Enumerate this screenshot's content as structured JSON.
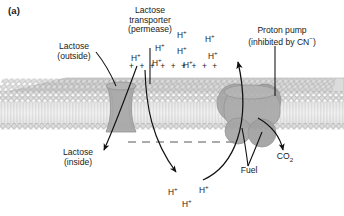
{
  "figure": {
    "panel_label": "(a)",
    "type": "membrane-transport-diagram",
    "title_implicit": "Lactose permease symport driven by proton gradient"
  },
  "labels": {
    "transporter": {
      "line1": "Lactose",
      "line2": "transporter",
      "line3": "(permease)"
    },
    "lactose_outside": {
      "line1": "Lactose",
      "line2": "(outside)"
    },
    "lactose_inside": {
      "line1": "Lactose",
      "line2": "(inside)"
    },
    "proton_pump": {
      "line1": "Proton pump",
      "line2": "(inhibited by CN",
      "charge": "−",
      "line2_end": ")"
    },
    "fuel": "Fuel",
    "co2": {
      "text": "CO",
      "subscript": "2"
    }
  },
  "ions": {
    "symbol": "H",
    "charge": "+",
    "outside_count": 8,
    "inside_count": 3,
    "outside_positions": [
      {
        "x": 177,
        "y": 29
      },
      {
        "x": 205,
        "y": 33
      },
      {
        "x": 155,
        "y": 42
      },
      {
        "x": 131,
        "y": 52
      },
      {
        "x": 177,
        "y": 45
      },
      {
        "x": 208,
        "y": 50
      },
      {
        "x": 152,
        "y": 57
      },
      {
        "x": 183,
        "y": 59
      }
    ],
    "inside_positions": [
      {
        "x": 168,
        "y": 186
      },
      {
        "x": 199,
        "y": 184
      },
      {
        "x": 182,
        "y": 198
      }
    ]
  },
  "charges": {
    "outer_row_symbol": "+",
    "outer_row_count": 9,
    "outer_row_label": "+ + + + + + + + +",
    "inner_row_symbol": "−",
    "inner_row_count": 8
  },
  "membrane": {
    "leaflets": 2,
    "headgroup_count_per_leaflet": 44,
    "description": "phospholipid bilayer slab in perspective"
  },
  "proteins": [
    {
      "name": "lactose-permease",
      "shape": "hourglass channel",
      "span": "transmembrane"
    },
    {
      "name": "proton-pump",
      "shape": "multi-lobed complex",
      "span": "transmembrane with cytosolic lobes"
    }
  ],
  "colors": {
    "membrane_head": "#d6d6d6",
    "membrane_tail": "#e8e8e8",
    "membrane_top": "#cfcfcf",
    "protein_fill": "#a8a8a8",
    "protein_stroke": "#8c8c8c",
    "arrow": "#111111",
    "text": "#1a1a1a",
    "background": "#ffffff"
  },
  "arrows": [
    {
      "name": "lactose-entry-arrow",
      "from": "outside",
      "to": "inside"
    },
    {
      "name": "lactose-leader-line",
      "from": "label",
      "to": "permease"
    },
    {
      "name": "transporter-leader-line",
      "from": "label",
      "to": "permease"
    },
    {
      "name": "proton-influx-arrow",
      "from": "outside-protons",
      "to": "cytosol"
    },
    {
      "name": "proton-efflux-arrow",
      "from": "cytosol-protons",
      "to": "outside"
    },
    {
      "name": "pump-leader-line",
      "from": "label",
      "to": "pump"
    },
    {
      "name": "fuel-arrow",
      "from": "fuel",
      "to": "pump"
    },
    {
      "name": "co2-arrow",
      "from": "pump",
      "to": "co2"
    }
  ]
}
